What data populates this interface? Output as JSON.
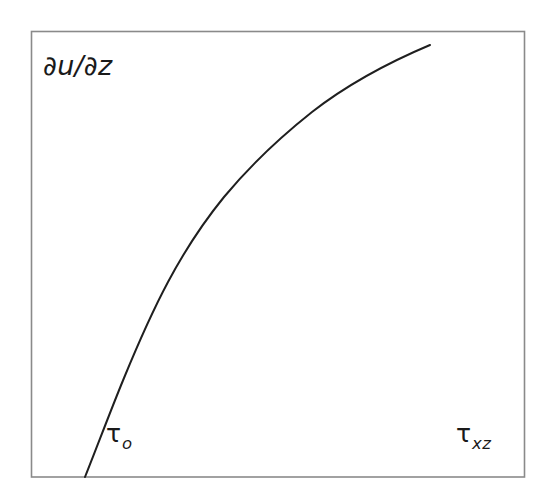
{
  "figure": {
    "name": "shear-rate-vs-shear-stress",
    "background_color": "#ffffff",
    "frame_color": "#8a8a8a",
    "curve_color": "#1f1f1f",
    "text_color": "#1a1a1a"
  },
  "labels": {
    "y_axis": "∂u/∂z",
    "yield_stress_symbol": "τ",
    "yield_stress_subscript": "o",
    "shear_stress_symbol": "τ",
    "shear_stress_subscript": "xz"
  },
  "chart_data": {
    "type": "line",
    "title": "",
    "xlabel": "τxz",
    "ylabel": "∂u/∂z",
    "grid": false,
    "legend": null,
    "annotations": [
      {
        "text": "τo",
        "meaning": "yield-stress-intercept",
        "x_px": 106,
        "y_px": 421
      },
      {
        "text": "τxz",
        "meaning": "shear-stress-axis",
        "x_px": 456,
        "y_px": 421
      }
    ],
    "axis_ranges": {
      "x_px": [
        31,
        525
      ],
      "y_px": [
        31,
        477
      ]
    },
    "series": [
      {
        "name": "shear-rate-curve",
        "x": [
          85,
          93,
          101,
          110,
          119,
          128,
          137,
          147,
          157,
          168,
          180,
          193,
          207,
          222,
          240,
          259,
          281,
          305,
          331,
          359,
          390,
          430
        ],
        "y": [
          477,
          459,
          442,
          425,
          408,
          392,
          376,
          361,
          346,
          331,
          316,
          301,
          287,
          273,
          258,
          243,
          227,
          211,
          194,
          177,
          159,
          139
        ]
      }
    ],
    "curve_path": "M 85 477 C 97 447 110 412 124 378 C 138 344 152 312 168 282 C 184 252 202 224 224 197 C 248 168 278 139 312 112 C 348 84 392 61 430 45"
  }
}
